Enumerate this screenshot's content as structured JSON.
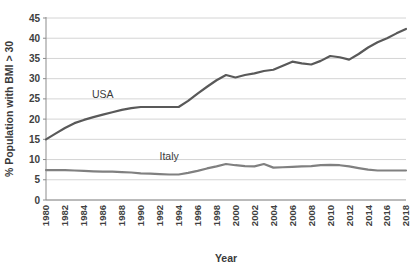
{
  "chart_data": {
    "type": "line",
    "title": "",
    "xlabel": "Year",
    "ylabel": "% Population with BMI > 30",
    "xlim": [
      1980,
      2018
    ],
    "ylim": [
      0,
      45
    ],
    "yticks": [
      0,
      5,
      10,
      15,
      20,
      25,
      30,
      35,
      40,
      45
    ],
    "xticks": [
      1980,
      1982,
      1984,
      1986,
      1988,
      1990,
      1992,
      1994,
      1996,
      1998,
      2000,
      2002,
      2004,
      2006,
      2008,
      2010,
      2012,
      2014,
      2016,
      2018
    ],
    "grid": "horizontal",
    "legend_position": "inline-annotation",
    "x": [
      1980,
      1981,
      1982,
      1983,
      1984,
      1985,
      1986,
      1987,
      1988,
      1989,
      1990,
      1991,
      1992,
      1993,
      1994,
      1995,
      1996,
      1997,
      1998,
      1999,
      2000,
      2001,
      2002,
      2003,
      2004,
      2005,
      2006,
      2007,
      2008,
      2009,
      2010,
      2011,
      2012,
      2013,
      2014,
      2015,
      2016,
      2017,
      2018
    ],
    "series": [
      {
        "name": "USA",
        "color": "#595959",
        "label_x": 1986,
        "label_y": 25.3,
        "values": [
          15.0,
          16.4,
          17.8,
          19.0,
          19.8,
          20.5,
          21.1,
          21.7,
          22.3,
          22.7,
          23.0,
          23.0,
          23.0,
          23.0,
          23.0,
          24.5,
          26.3,
          28.0,
          29.6,
          30.9,
          30.3,
          30.9,
          31.3,
          31.9,
          32.2,
          33.2,
          34.2,
          33.8,
          33.5,
          34.4,
          35.6,
          35.3,
          34.7,
          36.1,
          37.7,
          39.0,
          40.0,
          41.2,
          42.3
        ]
      },
      {
        "name": "Italy",
        "color": "#808080",
        "label_x": 1993,
        "label_y": 10.0,
        "values": [
          7.4,
          7.4,
          7.4,
          7.3,
          7.2,
          7.1,
          7.0,
          7.0,
          6.9,
          6.8,
          6.6,
          6.5,
          6.4,
          6.3,
          6.3,
          6.7,
          7.2,
          7.8,
          8.3,
          8.9,
          8.6,
          8.4,
          8.3,
          8.9,
          8.0,
          8.1,
          8.2,
          8.3,
          8.4,
          8.6,
          8.7,
          8.6,
          8.3,
          7.9,
          7.5,
          7.3,
          7.3,
          7.3,
          7.3
        ]
      }
    ]
  }
}
